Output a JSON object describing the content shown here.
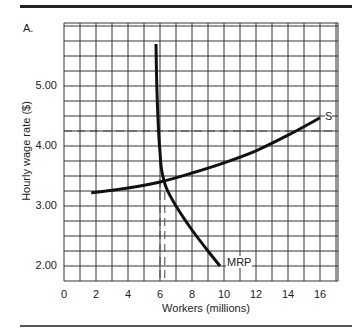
{
  "chart_data": {
    "type": "line",
    "panel_label": "A.",
    "title": "",
    "xlabel": "Workers (millions)",
    "ylabel": "Hourly wage rate ($)",
    "xlim": [
      0,
      17
    ],
    "ylim": [
      1.75,
      6.05
    ],
    "xticks": [
      "0",
      "2",
      "4",
      "6",
      "8",
      "10",
      "12",
      "14",
      "16"
    ],
    "yticks": [
      "2.00",
      "3.00",
      "4.00",
      "5.00"
    ],
    "grid": true,
    "series": [
      {
        "name": "S",
        "label": "S",
        "points": [
          [
            1.7,
            3.22
          ],
          [
            4,
            3.3
          ],
          [
            6,
            3.4
          ],
          [
            8,
            3.55
          ],
          [
            10,
            3.72
          ],
          [
            12,
            3.92
          ],
          [
            14,
            4.18
          ],
          [
            16,
            4.47
          ]
        ]
      },
      {
        "name": "MRP",
        "label": "MRP",
        "points": [
          [
            5.75,
            5.7
          ],
          [
            5.8,
            5.0
          ],
          [
            5.9,
            4.3
          ],
          [
            6.0,
            3.9
          ],
          [
            6.1,
            3.6
          ],
          [
            6.4,
            3.3
          ],
          [
            7.0,
            3.0
          ],
          [
            8.0,
            2.6
          ],
          [
            9.0,
            2.25
          ],
          [
            9.75,
            2.0
          ]
        ]
      }
    ],
    "reference_lines": [
      {
        "type": "horizontal",
        "style": "dashed",
        "y": 4.25
      },
      {
        "type": "vertical",
        "style": "dashed",
        "x": 6.0
      },
      {
        "type": "vertical",
        "style": "dashed",
        "x": 6.3
      }
    ],
    "intersection": {
      "x": 6.3,
      "y": 3.45
    }
  }
}
